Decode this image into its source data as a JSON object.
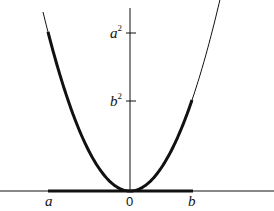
{
  "figure": {
    "labels": {
      "x_left": "a",
      "x_origin": "0",
      "x_right": "b",
      "y_upper": "a",
      "y_upper_exp": "2",
      "y_lower": "b",
      "y_lower_exp": "2"
    },
    "colors": {
      "stroke": "#111111",
      "background": "#ffffff"
    }
  }
}
